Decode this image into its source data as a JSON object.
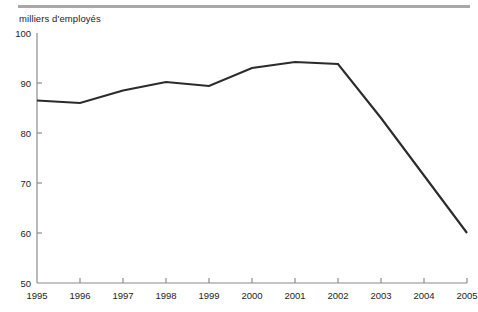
{
  "chart_data": {
    "type": "line",
    "title": "milliers d'employés",
    "xlabel": "",
    "ylabel": "milliers d'employés",
    "categories": [
      "1995",
      "1996",
      "1997",
      "1998",
      "1999",
      "2000",
      "2001",
      "2002",
      "2003",
      "2004",
      "2005"
    ],
    "x": [
      1995,
      1996,
      1997,
      1998,
      1999,
      2000,
      2001,
      2002,
      2003,
      2004,
      2005
    ],
    "values": [
      86.5,
      86.0,
      88.5,
      90.2,
      89.4,
      93.0,
      94.2,
      93.8,
      83.0,
      71.5,
      60.0
    ],
    "series": [
      {
        "name": "milliers d'employés",
        "values": [
          86.5,
          86.0,
          88.5,
          90.2,
          89.4,
          93.0,
          94.2,
          93.8,
          83.0,
          71.5,
          60.0
        ],
        "color": "#2b2b2b"
      }
    ],
    "ylim": [
      50,
      100
    ],
    "yticks": [
      50,
      60,
      70,
      80,
      90,
      100
    ],
    "ytick_labels": [
      "50",
      "60",
      "70",
      "80",
      "90",
      "100"
    ],
    "xlim": [
      1995,
      2005
    ],
    "xticks": [
      1995,
      1996,
      1997,
      1998,
      1999,
      2000,
      2001,
      2002,
      2003,
      2004,
      2005
    ],
    "xtick_labels": [
      "1995",
      "1996",
      "1997",
      "1998",
      "1999",
      "2000",
      "2001",
      "2002",
      "2003",
      "2004",
      "2005"
    ],
    "grid": false,
    "legend": false,
    "legend_position": "none"
  },
  "style": {
    "line_color": "#2b2b2b",
    "axis_color": "#8c8c8c",
    "rule_color": "#a8a8a8",
    "text_color": "#1d1d1d",
    "background": "#ffffff"
  }
}
